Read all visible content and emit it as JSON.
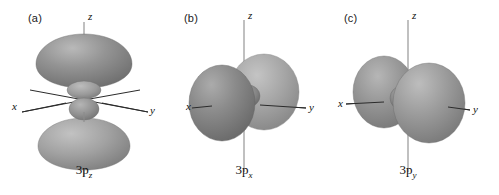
{
  "figure": {
    "background_color": "#ffffff",
    "lobe_color_dark": "#7d7d7d",
    "lobe_color_mid": "#949494",
    "lobe_color_light": "#b2b2b2",
    "axis_color": "#2b2b2b"
  },
  "panels": [
    {
      "letter": "(a)",
      "orbital_label": "3p",
      "orbital_subscript": "z",
      "axes": {
        "z": "z",
        "x": "x",
        "y": "y"
      },
      "description": "3p-z orbital: large lobes above and below along z with small inner lobes"
    },
    {
      "letter": "(b)",
      "orbital_label": "3p",
      "orbital_subscript": "x",
      "axes": {
        "z": "z",
        "x": "x",
        "y": "y"
      },
      "description": "3p-x orbital: large lobes along x axis with small inner lobe"
    },
    {
      "letter": "(c)",
      "orbital_label": "3p",
      "orbital_subscript": "y",
      "axes": {
        "z": "z",
        "x": "x",
        "y": "y"
      },
      "description": "3p-y orbital: large lobes along y axis with small inner lobe"
    }
  ]
}
